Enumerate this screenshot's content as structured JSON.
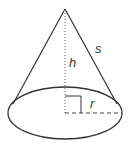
{
  "diagram": {
    "labels": {
      "slant_height": "s",
      "height": "h",
      "radius": "r"
    },
    "colors": {
      "stroke": "#333333",
      "background": "#ffffff"
    },
    "geometry": {
      "apex": [
        65,
        9
      ],
      "base_center": [
        65,
        113
      ],
      "base_rx": 57,
      "base_ry": 26
    }
  }
}
